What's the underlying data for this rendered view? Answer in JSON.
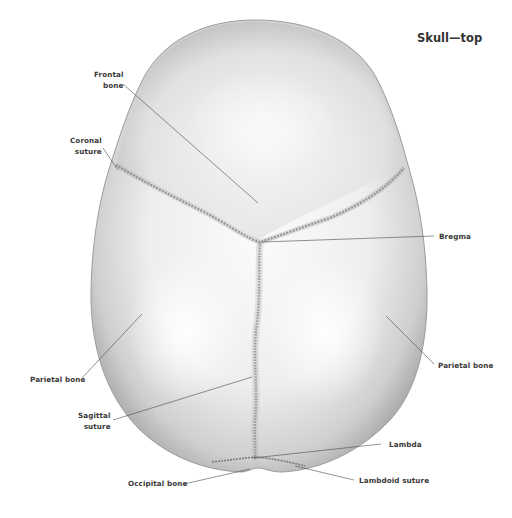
{
  "title": "Skull—top",
  "labels": {
    "frontal_bone": {
      "line1": "Frontal",
      "line2": "bone"
    },
    "coronal_suture": {
      "line1": "Coronal",
      "line2": "suture"
    },
    "bregma": "Bregma",
    "parietal_bone_left": "Parietal bone",
    "parietal_bone_right": "Parietal bone",
    "sagittal_suture": {
      "line1": "Sagittal",
      "line2": "suture"
    },
    "lambda": "Lambda",
    "occipital_bone": "Occipital bone",
    "lambdoid_suture": "Lambdoid suture"
  },
  "colors": {
    "background": "#ffffff",
    "bone_light": "#f4f4f4",
    "bone_mid": "#cfcfcf",
    "bone_dark": "#8c8c8c",
    "suture": "#6e6e6e",
    "leader_line": "#4a4a4a",
    "text": "#3a3a3a"
  },
  "leaders": [
    {
      "name": "frontal-bone",
      "x1": 123,
      "y1": 84,
      "x2": 258,
      "y2": 203
    },
    {
      "name": "coronal-suture",
      "x1": 103,
      "y1": 148,
      "x2": 118,
      "y2": 170
    },
    {
      "name": "bregma",
      "x1": 262,
      "y1": 242,
      "x2": 434,
      "y2": 236
    },
    {
      "name": "parietal-bone-left",
      "x1": 82,
      "y1": 378,
      "x2": 142,
      "y2": 314
    },
    {
      "name": "parietal-bone-right",
      "x1": 434,
      "y1": 364,
      "x2": 386,
      "y2": 316
    },
    {
      "name": "sagittal-suture",
      "x1": 113,
      "y1": 420,
      "x2": 252,
      "y2": 377
    },
    {
      "name": "lambda",
      "x1": 381,
      "y1": 444,
      "x2": 253,
      "y2": 458
    },
    {
      "name": "occipital-bone",
      "x1": 184,
      "y1": 484,
      "x2": 250,
      "y2": 469
    },
    {
      "name": "lambdoid-suture",
      "x1": 354,
      "y1": 480,
      "x2": 295,
      "y2": 466
    }
  ]
}
